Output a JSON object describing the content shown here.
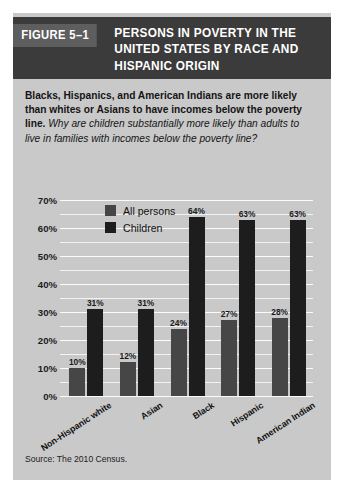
{
  "figure": {
    "number_label": "FIGURE 5–1",
    "title": "PERSONS IN POVERTY IN THE UNITED STATES BY RACE AND HISPANIC ORIGIN",
    "caption_bold": "Blacks, Hispanics, and American Indians are more likely than whites or Asians to have incomes below the poverty line.",
    "caption_italic": "Why are children substantially more likely than adults to live in families with incomes below the poverty line?",
    "source": "Source: The 2010 Census."
  },
  "colors": {
    "title_bar": "#3b3b3b",
    "figure_number_box": "#5e5e5e",
    "panel_background": "#c9c9c9",
    "all_persons_bar": "#464646",
    "children_bar": "#1d1d1d",
    "gridline": "#f2f2f2"
  },
  "chart_data": {
    "type": "bar",
    "title": "PERSONS IN POVERTY IN THE UNITED STATES BY RACE AND HISPANIC ORIGIN",
    "xlabel": "",
    "ylabel": "",
    "ylim": [
      0,
      70
    ],
    "ytick_step": 10,
    "grid": true,
    "grid_minor_step": 5,
    "legend_position": "upper-left-inside",
    "categories": [
      "Non-Hispanic white",
      "Asian",
      "Black",
      "Hispanic",
      "American Indian"
    ],
    "ytick_labels": [
      "0%",
      "10%",
      "20%",
      "30%",
      "40%",
      "50%",
      "60%",
      "70%"
    ],
    "series": [
      {
        "name": "All persons",
        "color": "#464646",
        "values": [
          10,
          12,
          24,
          27,
          28
        ],
        "value_labels": [
          "10%",
          "12%",
          "24%",
          "27%",
          "28%"
        ]
      },
      {
        "name": "Children",
        "color": "#1d1d1d",
        "values": [
          31,
          31,
          64,
          63,
          63
        ],
        "value_labels": [
          "31%",
          "31%",
          "64%",
          "63%",
          "63%"
        ]
      }
    ]
  }
}
